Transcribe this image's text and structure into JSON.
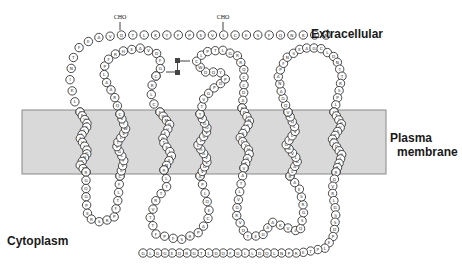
{
  "labels": {
    "extracellular": "Extracellular",
    "plasma_membrane_line1": "Plasma",
    "plasma_membrane_line2": "membrane",
    "cytoplasm": "Cytoplasm"
  },
  "annotations": {
    "glycosylation_1": "CHO",
    "glycosylation_2": "CHO",
    "disulfide_s1": "S",
    "disulfide_s2": "S"
  },
  "colors": {
    "membrane_fill": "#d9d9d9",
    "membrane_stroke": "#888888",
    "residue_stroke": "#333333",
    "text": "#1a1a1a"
  },
  "membrane": {
    "x": 22,
    "y": 110,
    "width": 364,
    "height": 64
  },
  "residue_radius": 4.2,
  "segments": [
    {
      "name": "n-terminus",
      "pts": [
        [
          326,
          35
        ],
        [
          300,
          35
        ],
        [
          270,
          35
        ],
        [
          240,
          35
        ],
        [
          210,
          35
        ],
        [
          180,
          35
        ],
        [
          150,
          35
        ],
        [
          120,
          35
        ],
        [
          95,
          38
        ],
        [
          80,
          46
        ],
        [
          72,
          60
        ],
        [
          70,
          80
        ],
        [
          74,
          100
        ],
        [
          80,
          112
        ]
      ],
      "seq": "NRKNQFSECLVEPFYKLTQVAEFTNIKLE"
    },
    {
      "name": "tm1",
      "pts": [
        [
          80,
          112
        ],
        [
          88,
          125
        ],
        [
          80,
          138
        ],
        [
          88,
          152
        ],
        [
          80,
          165
        ],
        [
          86,
          172
        ]
      ],
      "seq": "AFVCGLLAVLAGNCVTA"
    },
    {
      "name": "icl1",
      "pts": [
        [
          86,
          172
        ],
        [
          86,
          200
        ],
        [
          88,
          218
        ],
        [
          100,
          222
        ],
        [
          114,
          218
        ],
        [
          118,
          200
        ],
        [
          120,
          176
        ]
      ],
      "seq": "RGQGPERSRPFTLFP"
    },
    {
      "name": "tm2",
      "pts": [
        [
          120,
          176
        ],
        [
          124,
          160
        ],
        [
          116,
          145
        ],
        [
          126,
          130
        ],
        [
          120,
          114
        ]
      ],
      "seq": "CLVFLGVTLVWTVY"
    },
    {
      "name": "ecl1",
      "pts": [
        [
          120,
          114
        ],
        [
          114,
          95
        ],
        [
          104,
          78
        ],
        [
          105,
          62
        ],
        [
          118,
          52
        ],
        [
          140,
          48
        ],
        [
          158,
          54
        ],
        [
          162,
          66
        ],
        [
          156,
          76
        ]
      ],
      "seq": "CQRAALPFRHEAVDFGQ"
    },
    {
      "name": "ecl1b",
      "pts": [
        [
          156,
          76
        ],
        [
          150,
          90
        ],
        [
          154,
          104
        ],
        [
          160,
          112
        ]
      ],
      "seq": "CRLCC"
    },
    {
      "name": "tm3",
      "pts": [
        [
          160,
          112
        ],
        [
          170,
          125
        ],
        [
          162,
          140
        ],
        [
          172,
          155
        ],
        [
          164,
          170
        ]
      ],
      "seq": "FWMGVFGTFLAANK"
    },
    {
      "name": "icl2",
      "pts": [
        [
          164,
          170
        ],
        [
          168,
          185
        ],
        [
          156,
          200
        ],
        [
          150,
          218
        ],
        [
          156,
          234
        ],
        [
          180,
          240
        ],
        [
          200,
          232
        ],
        [
          210,
          215
        ],
        [
          206,
          196
        ],
        [
          200,
          176
        ]
      ],
      "seq": "RLYTRVTTFPFSRPACEQLPA"
    },
    {
      "name": "tm4",
      "pts": [
        [
          200,
          176
        ],
        [
          208,
          160
        ],
        [
          198,
          145
        ],
        [
          208,
          130
        ],
        [
          200,
          114
        ]
      ],
      "seq": "AVGLVAHLLSVQGVW"
    },
    {
      "name": "ecl2",
      "pts": [
        [
          200,
          114
        ],
        [
          204,
          98
        ],
        [
          214,
          88
        ],
        [
          226,
          80
        ],
        [
          220,
          72
        ],
        [
          204,
          72
        ],
        [
          196,
          62
        ],
        [
          204,
          52
        ],
        [
          222,
          50
        ],
        [
          238,
          56
        ],
        [
          244,
          70
        ],
        [
          244,
          90
        ],
        [
          242,
          108
        ]
      ],
      "seq": "TTVGPDPYQDWCLPTLGRRQCCDAV"
    },
    {
      "name": "tm5",
      "pts": [
        [
          242,
          108
        ],
        [
          250,
          122
        ],
        [
          240,
          138
        ],
        [
          250,
          152
        ],
        [
          244,
          168
        ]
      ],
      "seq": "PQLNFLSDGYVLSTF"
    },
    {
      "name": "icl3",
      "pts": [
        [
          244,
          168
        ],
        [
          240,
          190
        ],
        [
          236,
          214
        ],
        [
          246,
          236
        ],
        [
          262,
          236
        ],
        [
          272,
          222
        ],
        [
          288,
          228
        ],
        [
          300,
          232
        ],
        [
          304,
          210
        ],
        [
          300,
          190
        ],
        [
          290,
          176
        ]
      ],
      "seq": "VATLVGRVDTEGAAKVLQSGRSEAN"
    },
    {
      "name": "tm6",
      "pts": [
        [
          290,
          176
        ],
        [
          298,
          160
        ],
        [
          286,
          145
        ],
        [
          296,
          130
        ],
        [
          288,
          112
        ]
      ],
      "seq": "RLAALVNGFLVLQCF"
    },
    {
      "name": "ecl3",
      "pts": [
        [
          288,
          112
        ],
        [
          282,
          95
        ],
        [
          278,
          75
        ],
        [
          286,
          58
        ],
        [
          302,
          48
        ],
        [
          320,
          48
        ],
        [
          336,
          58
        ],
        [
          342,
          76
        ],
        [
          338,
          96
        ],
        [
          334,
          112
        ]
      ],
      "seq": "VQGANAPFNSEAGCLDNTTRSPLS"
    },
    {
      "name": "tm7",
      "pts": [
        [
          334,
          112
        ],
        [
          342,
          125
        ],
        [
          332,
          140
        ],
        [
          342,
          155
        ],
        [
          336,
          172
        ]
      ],
      "seq": "LTIPVATWLGYSLAFL"
    },
    {
      "name": "c-terminus",
      "pts": [
        [
          336,
          172
        ],
        [
          332,
          190
        ],
        [
          336,
          212
        ],
        [
          334,
          235
        ],
        [
          326,
          248
        ],
        [
          300,
          253
        ],
        [
          260,
          253
        ],
        [
          220,
          253
        ],
        [
          180,
          253
        ],
        [
          143,
          253
        ]
      ],
      "seq": "RGVRLGSSDPELPTERPNLQDLLGFQDLTGRQEGGLG"
    }
  ]
}
